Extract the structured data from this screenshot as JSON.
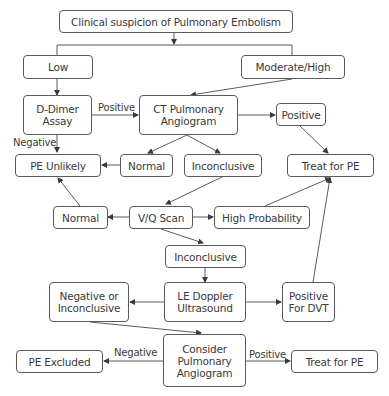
{
  "diagram": {
    "title": "Clinical suspicion of Pulmonary Embolism",
    "nodes": {
      "root": "Clinical suspicion of Pulmonary Embolism",
      "low": "Low",
      "moderate_high": "Moderate/High",
      "d_dimer": "D-Dimer\nAssay",
      "ct_angiogram": "CT Pulmonary\nAngiogram",
      "ct_positive": "Positive",
      "pe_unlikely": "PE Unlikely",
      "ct_normal": "Normal",
      "ct_inconclusive": "Inconclusive",
      "treat_pe_1": "Treat for PE",
      "vq_normal": "Normal",
      "vq_scan": "V/Q Scan",
      "high_probability": "High Probability",
      "vq_inconclusive": "Inconclusive",
      "neg_or_inconclusive": "Negative or\nInconclusive",
      "le_doppler": "LE Doppler\nUltrasound",
      "positive_dvt": "Positive\nFor DVT",
      "pe_excluded": "PE Excluded",
      "consider_angiogram": "Consider\nPulmonary\nAngiogram",
      "treat_pe_2": "Treat for PE"
    },
    "edge_labels": {
      "ddimer_positive": "Positive",
      "ddimer_negative": "Negative",
      "consider_negative": "Negative",
      "consider_positive": "Positive"
    },
    "colors": {
      "line": "#4a4a4a",
      "border": "#5a5a5a",
      "text": "#3a3a3a"
    }
  }
}
